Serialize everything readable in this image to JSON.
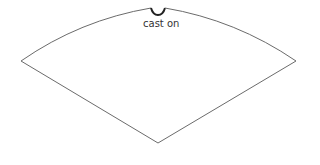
{
  "diagram": {
    "labels": {
      "cast_on": "cast on"
    },
    "colors": {
      "stroke": "#6b6b6b",
      "notch": "#222222",
      "background": "#ffffff"
    },
    "shape": {
      "type": "circular-sector",
      "left_corner": [
        21,
        61
      ],
      "right_corner": [
        296,
        61
      ],
      "bottom_tip": [
        158,
        143
      ],
      "notch_center": [
        158,
        8
      ]
    }
  }
}
